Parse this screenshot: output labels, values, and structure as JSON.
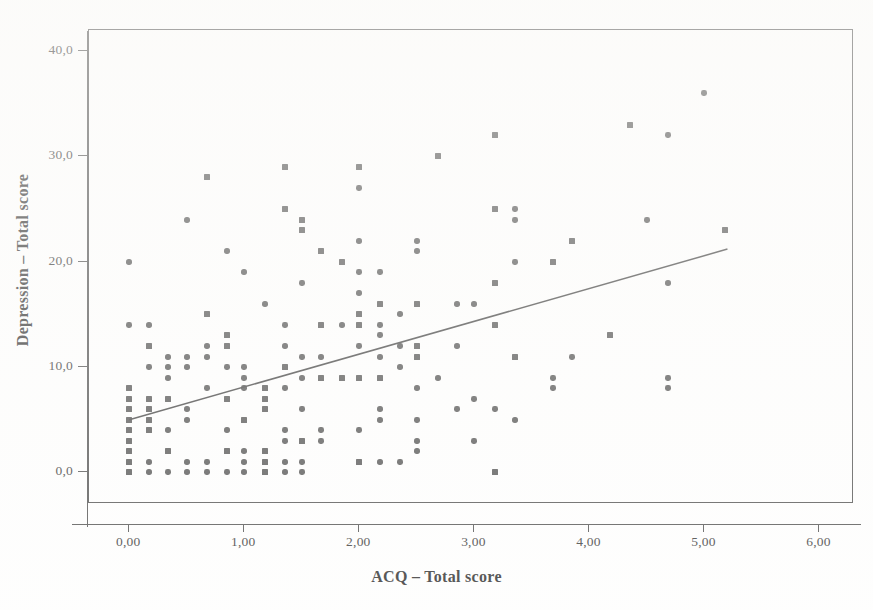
{
  "chart_data": {
    "type": "scatter",
    "title": "",
    "subtitle": "",
    "xlabel": "ACQ – Total score",
    "ylabel": "Depression – Total score",
    "xlim": [
      -0.35,
      6.3
    ],
    "ylim": [
      -3.0,
      42.0
    ],
    "xticks": [
      0,
      1,
      2,
      3,
      4,
      5,
      6
    ],
    "xticklabels": [
      "0,00",
      "1,00",
      "2,00",
      "3,00",
      "4,00",
      "5,00",
      "6,00"
    ],
    "yticks": [
      0,
      10,
      20,
      30,
      40
    ],
    "yticklabels": [
      "0,0",
      "10,0",
      "20,0",
      "30,0",
      "40,0"
    ],
    "grid": false,
    "legend": null,
    "marker_color": "#4b4b4b",
    "line_color": "#3a3a3a",
    "decimal_separator": ",",
    "fit_line": {
      "type": "linear",
      "x_start": 0.0,
      "y_start": 5.0,
      "x_end": 5.2,
      "y_end": 21.2,
      "slope": 3.12,
      "intercept": 5.0
    },
    "points": [
      [
        0.0,
        20.0
      ],
      [
        0.0,
        14.0
      ],
      [
        0.0,
        8.0
      ],
      [
        0.0,
        7.0
      ],
      [
        0.0,
        6.0
      ],
      [
        0.0,
        5.0
      ],
      [
        0.0,
        4.0
      ],
      [
        0.0,
        3.0
      ],
      [
        0.0,
        2.0
      ],
      [
        0.0,
        1.0
      ],
      [
        0.0,
        0.0
      ],
      [
        0.17,
        14.0
      ],
      [
        0.17,
        12.0
      ],
      [
        0.17,
        10.0
      ],
      [
        0.17,
        7.0
      ],
      [
        0.17,
        6.0
      ],
      [
        0.17,
        5.0
      ],
      [
        0.17,
        4.0
      ],
      [
        0.17,
        1.0
      ],
      [
        0.17,
        0.0
      ],
      [
        0.34,
        11.0
      ],
      [
        0.34,
        10.0
      ],
      [
        0.34,
        9.0
      ],
      [
        0.34,
        7.0
      ],
      [
        0.34,
        4.0
      ],
      [
        0.34,
        2.0
      ],
      [
        0.34,
        0.0
      ],
      [
        0.5,
        24.0
      ],
      [
        0.5,
        11.0
      ],
      [
        0.5,
        10.0
      ],
      [
        0.5,
        6.0
      ],
      [
        0.5,
        5.0
      ],
      [
        0.5,
        1.0
      ],
      [
        0.5,
        0.0
      ],
      [
        0.68,
        28.0
      ],
      [
        0.68,
        15.0
      ],
      [
        0.68,
        12.0
      ],
      [
        0.68,
        11.0
      ],
      [
        0.68,
        8.0
      ],
      [
        0.68,
        1.0
      ],
      [
        0.68,
        0.0
      ],
      [
        0.85,
        21.0
      ],
      [
        0.85,
        13.0
      ],
      [
        0.85,
        12.0
      ],
      [
        0.85,
        10.0
      ],
      [
        0.85,
        7.0
      ],
      [
        0.85,
        4.0
      ],
      [
        0.85,
        2.0
      ],
      [
        0.85,
        0.0
      ],
      [
        1.0,
        19.0
      ],
      [
        1.0,
        10.0
      ],
      [
        1.0,
        9.0
      ],
      [
        1.0,
        8.0
      ],
      [
        1.0,
        5.0
      ],
      [
        1.0,
        2.0
      ],
      [
        1.0,
        1.0
      ],
      [
        1.0,
        0.0
      ],
      [
        1.18,
        16.0
      ],
      [
        1.18,
        8.0
      ],
      [
        1.18,
        7.0
      ],
      [
        1.18,
        6.0
      ],
      [
        1.18,
        2.0
      ],
      [
        1.18,
        1.0
      ],
      [
        1.18,
        0.0
      ],
      [
        1.35,
        29.0
      ],
      [
        1.35,
        25.0
      ],
      [
        1.35,
        14.0
      ],
      [
        1.35,
        12.0
      ],
      [
        1.35,
        10.0
      ],
      [
        1.35,
        8.0
      ],
      [
        1.35,
        4.0
      ],
      [
        1.35,
        3.0
      ],
      [
        1.35,
        1.0
      ],
      [
        1.35,
        0.0
      ],
      [
        1.5,
        24.0
      ],
      [
        1.5,
        23.0
      ],
      [
        1.5,
        18.0
      ],
      [
        1.5,
        11.0
      ],
      [
        1.5,
        9.0
      ],
      [
        1.5,
        6.0
      ],
      [
        1.5,
        3.0
      ],
      [
        1.5,
        1.0
      ],
      [
        1.5,
        0.0
      ],
      [
        1.67,
        21.0
      ],
      [
        1.67,
        14.0
      ],
      [
        1.67,
        11.0
      ],
      [
        1.67,
        9.0
      ],
      [
        1.67,
        4.0
      ],
      [
        1.67,
        3.0
      ],
      [
        1.85,
        20.0
      ],
      [
        1.85,
        14.0
      ],
      [
        1.85,
        9.0
      ],
      [
        2.0,
        29.0
      ],
      [
        2.0,
        27.0
      ],
      [
        2.0,
        22.0
      ],
      [
        2.0,
        19.0
      ],
      [
        2.0,
        17.0
      ],
      [
        2.0,
        15.0
      ],
      [
        2.0,
        14.0
      ],
      [
        2.0,
        12.0
      ],
      [
        2.0,
        9.0
      ],
      [
        2.0,
        4.0
      ],
      [
        2.0,
        1.0
      ],
      [
        2.18,
        19.0
      ],
      [
        2.18,
        16.0
      ],
      [
        2.18,
        14.0
      ],
      [
        2.18,
        13.0
      ],
      [
        2.18,
        11.0
      ],
      [
        2.18,
        9.0
      ],
      [
        2.18,
        6.0
      ],
      [
        2.18,
        5.0
      ],
      [
        2.18,
        1.0
      ],
      [
        2.35,
        15.0
      ],
      [
        2.35,
        12.0
      ],
      [
        2.35,
        10.0
      ],
      [
        2.35,
        1.0
      ],
      [
        2.5,
        22.0
      ],
      [
        2.5,
        21.0
      ],
      [
        2.5,
        16.0
      ],
      [
        2.5,
        12.0
      ],
      [
        2.5,
        11.0
      ],
      [
        2.5,
        8.0
      ],
      [
        2.5,
        5.0
      ],
      [
        2.5,
        3.0
      ],
      [
        2.5,
        2.0
      ],
      [
        2.68,
        30.0
      ],
      [
        2.68,
        9.0
      ],
      [
        2.85,
        16.0
      ],
      [
        2.85,
        12.0
      ],
      [
        2.85,
        6.0
      ],
      [
        3.0,
        16.0
      ],
      [
        3.0,
        7.0
      ],
      [
        3.0,
        3.0
      ],
      [
        3.18,
        32.0
      ],
      [
        3.18,
        25.0
      ],
      [
        3.18,
        18.0
      ],
      [
        3.18,
        14.0
      ],
      [
        3.18,
        6.0
      ],
      [
        3.18,
        0.0
      ],
      [
        3.35,
        25.0
      ],
      [
        3.35,
        24.0
      ],
      [
        3.35,
        20.0
      ],
      [
        3.35,
        11.0
      ],
      [
        3.35,
        5.0
      ],
      [
        3.68,
        20.0
      ],
      [
        3.68,
        9.0
      ],
      [
        3.68,
        8.0
      ],
      [
        3.85,
        22.0
      ],
      [
        3.85,
        11.0
      ],
      [
        4.18,
        13.0
      ],
      [
        4.35,
        33.0
      ],
      [
        4.5,
        24.0
      ],
      [
        4.68,
        32.0
      ],
      [
        4.68,
        18.0
      ],
      [
        4.68,
        9.0
      ],
      [
        4.68,
        8.0
      ],
      [
        5.0,
        36.0
      ],
      [
        5.18,
        23.0
      ]
    ],
    "n_points": 161,
    "relationship": "positive linear association between ACQ total score and Depression total score"
  }
}
